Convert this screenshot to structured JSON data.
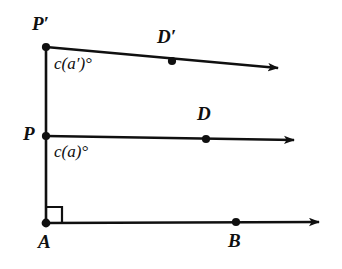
{
  "figure": {
    "stroke_color": "#101010",
    "background_color": "#ffffff",
    "labels": {
      "p_prime": "P′",
      "p": "P",
      "a": "A",
      "d_prime": "D′",
      "d": "D",
      "b": "B",
      "angle_upper": "c(a′)°",
      "angle_lower": "c(a)°"
    }
  },
  "geometry": {
    "points": [
      {
        "name": "P-prime",
        "x": 46,
        "y": 47
      },
      {
        "name": "P",
        "x": 46,
        "y": 136
      },
      {
        "name": "A",
        "x": 46,
        "y": 223
      },
      {
        "name": "D-prime",
        "x": 172,
        "y": 61
      },
      {
        "name": "D",
        "x": 206,
        "y": 139
      },
      {
        "name": "B",
        "x": 236,
        "y": 222
      }
    ],
    "rays": [
      {
        "name": "ray-P-prime-D-prime",
        "from_x": 46,
        "from_y": 47,
        "to_x": 281,
        "to_y": 68
      },
      {
        "name": "ray-P-D",
        "from_x": 46,
        "from_y": 136,
        "to_x": 297,
        "to_y": 140
      },
      {
        "name": "ray-A-B",
        "from_x": 46,
        "from_y": 223,
        "to_x": 322,
        "to_y": 222
      }
    ],
    "segments": [
      {
        "name": "segment-P-prime-A",
        "from_x": 46,
        "from_y": 47,
        "to_x": 46,
        "to_y": 223
      }
    ],
    "right_angle_marker": {
      "name": "right-angle-at-A",
      "corner_x": 46,
      "corner_y": 223,
      "size": 16
    }
  }
}
